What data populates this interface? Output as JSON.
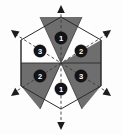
{
  "figure": {
    "type": "hexagon-sector-diagram",
    "canvas": {
      "width": 122,
      "height": 135
    },
    "center": {
      "x": 61,
      "y": 63
    },
    "hexagon": {
      "radius": 46,
      "orientation": "pointy-top",
      "vertices": [
        {
          "name": "top",
          "x": 61,
          "y": 17
        },
        {
          "name": "upper-right",
          "x": 101,
          "y": 40
        },
        {
          "name": "lower-right",
          "x": 101,
          "y": 86
        },
        {
          "name": "bottom",
          "x": 61,
          "y": 109
        },
        {
          "name": "lower-left",
          "x": 21,
          "y": 86
        },
        {
          "name": "upper-left",
          "x": 21,
          "y": 40
        }
      ]
    },
    "colors": {
      "sector_dark": "#6e6e6e",
      "sector_light": "#fefefe",
      "outline": "#2b2b2b",
      "dashed_axis": "#3a3a3a",
      "label_circle_fill": "#141414",
      "label_text": "#ffffff",
      "arrow_fill": "#1c1c1c",
      "background": "#fdfdfd"
    },
    "sectors": [
      {
        "id": "sector-top",
        "position": "top",
        "fill": "dark",
        "label": "1",
        "label_x": 61,
        "label_y": 38
      },
      {
        "id": "sector-upper-right",
        "position": "upper-right",
        "fill": "light",
        "label": "2",
        "label_x": 81,
        "label_y": 51
      },
      {
        "id": "sector-lower-right",
        "position": "lower-right",
        "fill": "dark",
        "label": "3",
        "label_x": 81,
        "label_y": 76
      },
      {
        "id": "sector-bottom",
        "position": "bottom",
        "fill": "light",
        "label": "1",
        "label_x": 61,
        "label_y": 89
      },
      {
        "id": "sector-lower-left",
        "position": "lower-left",
        "fill": "dark",
        "label": "2",
        "label_x": 40,
        "label_y": 76
      },
      {
        "id": "sector-upper-left",
        "position": "upper-left",
        "fill": "light",
        "label": "3",
        "label_x": 40,
        "label_y": 51
      }
    ],
    "axes": [
      {
        "id": "axis-vertical",
        "style": "dashed",
        "from": {
          "x": 61,
          "y": 8
        },
        "to": {
          "x": 61,
          "y": 127
        }
      },
      {
        "id": "axis-diagonal-nwse",
        "style": "dashed",
        "from": {
          "x": 14,
          "y": 33
        },
        "to": {
          "x": 108,
          "y": 93
        }
      },
      {
        "id": "axis-diagonal-nesw",
        "style": "dashed",
        "from": {
          "x": 108,
          "y": 33
        },
        "to": {
          "x": 14,
          "y": 93
        }
      }
    ],
    "arrows": [
      {
        "id": "arrow-up",
        "direction": "up",
        "tip_x": 61,
        "tip_y": 6
      },
      {
        "id": "arrow-down",
        "direction": "down",
        "tip_x": 61,
        "tip_y": 129
      },
      {
        "id": "arrow-upper-left",
        "direction": "up-left",
        "tip_x": 12,
        "tip_y": 32
      },
      {
        "id": "arrow-upper-right",
        "direction": "up-right",
        "tip_x": 110,
        "tip_y": 32
      },
      {
        "id": "arrow-lower-left",
        "direction": "down-left",
        "tip_x": 12,
        "tip_y": 94
      },
      {
        "id": "arrow-lower-right",
        "direction": "down-right",
        "tip_x": 110,
        "tip_y": 94
      }
    ],
    "guide_lines": [
      {
        "id": "guide-horizontal",
        "style": "solid",
        "from": {
          "x": 21,
          "y": 63
        },
        "to": {
          "x": 101,
          "y": 63
        }
      },
      {
        "id": "guide-vertical-left",
        "style": "solid",
        "from": {
          "x": 21,
          "y": 40
        },
        "to": {
          "x": 21,
          "y": 86
        }
      },
      {
        "id": "guide-vertical-right",
        "style": "solid",
        "from": {
          "x": 101,
          "y": 40
        },
        "to": {
          "x": 101,
          "y": 86
        }
      }
    ]
  }
}
